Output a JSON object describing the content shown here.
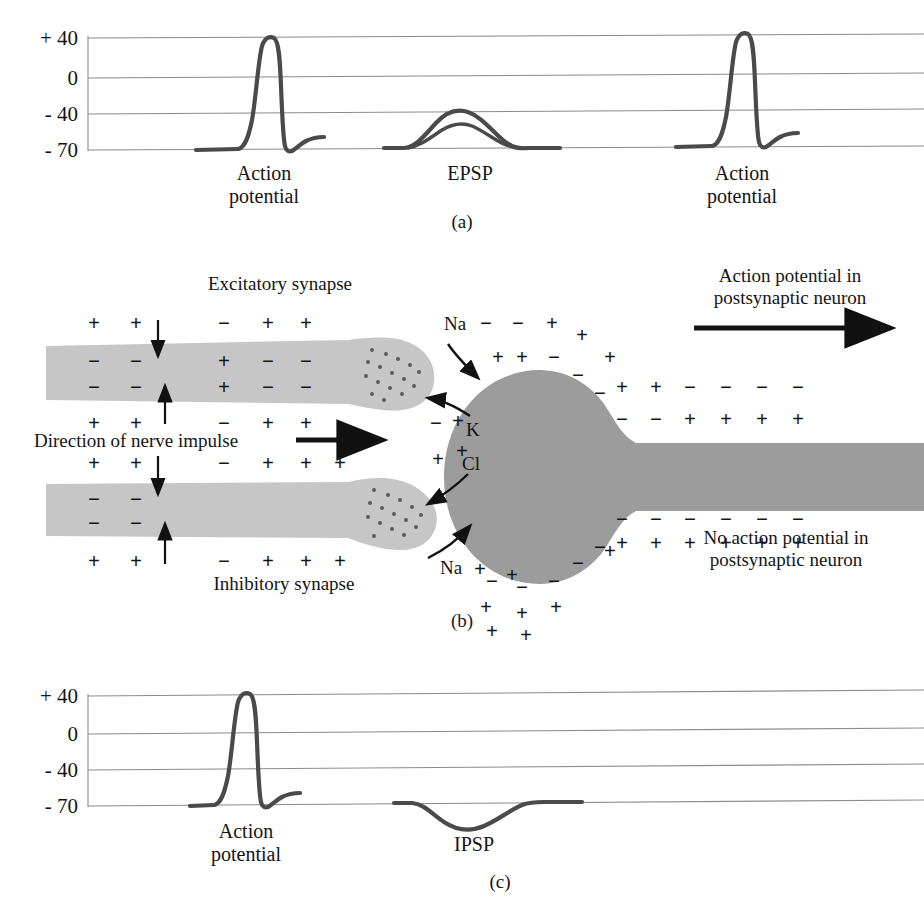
{
  "figure": {
    "colors": {
      "presynaptic_gray": "#c6c6c6",
      "postsynaptic_gray": "#9c9c9c",
      "trace": "#4a4a4a",
      "gridline": "#8b8b8b",
      "text": "#141414"
    }
  },
  "panel_a": {
    "id_label": "(a)",
    "y_axis": {
      "unit": "mV",
      "ticks": [
        "+ 40",
        "0",
        "- 40",
        "- 70"
      ],
      "values": [
        40,
        0,
        -40,
        -70
      ]
    },
    "events": [
      {
        "label_line1": "Action",
        "label_line2": "potential",
        "type": "action-potential",
        "peak_mv": 42,
        "baseline_mv": -70
      },
      {
        "label_line1": "EPSP",
        "label_line2": "",
        "type": "epsp",
        "peak_mv": -38,
        "baseline_mv": -70
      },
      {
        "label_line1": "Action",
        "label_line2": "potential",
        "type": "action-potential",
        "peak_mv": 42,
        "baseline_mv": -70
      }
    ]
  },
  "panel_b": {
    "id_label": "(b)",
    "excitatory_label": "Excitatory synapse",
    "inhibitory_label": "Inhibitory synapse",
    "direction_label": "Direction of nerve impulse",
    "action_potential_label_line1": "Action potential in",
    "action_potential_label_line2": "postsynaptic neuron",
    "no_action_potential_label_line1": "No action potential in",
    "no_action_potential_label_line2": "postsynaptic neuron",
    "ions": [
      {
        "name": "Na",
        "position": "upper-cleft",
        "direction": "into-soma"
      },
      {
        "name": "K",
        "position": "upper-cleft",
        "direction": "out-of-soma"
      },
      {
        "name": "Cl",
        "position": "lower-cleft",
        "direction": "out-of-soma"
      },
      {
        "name": "Na",
        "position": "lower-cleft",
        "direction": "into-soma"
      }
    ],
    "excitatory_axon_charges": {
      "outer_top": [
        "+",
        "+",
        "-",
        "+",
        "+"
      ],
      "inner_top": [
        "-",
        "-",
        "+",
        "-",
        "-"
      ],
      "inner_bottom": [
        "-",
        "-",
        "+",
        "-",
        "-"
      ],
      "outer_bottom": [
        "+",
        "+",
        "-",
        "+",
        "+"
      ]
    },
    "inhibitory_axon_charges": {
      "outer_top": [
        "+",
        "+",
        "-",
        "+",
        "+",
        "+"
      ],
      "inner_top": [
        "-",
        "-"
      ],
      "inner_bottom": [
        "-",
        "-"
      ],
      "outer_bottom": [
        "+",
        "+",
        "-",
        "+",
        "+",
        "+"
      ]
    },
    "soma_charges": {
      "outer_top": [
        "-",
        "-",
        "+",
        "+",
        "+",
        "+",
        "+"
      ],
      "inner_top": [
        "+",
        "+",
        "-",
        "-",
        "-",
        "-",
        "-"
      ],
      "outer_bottom": [
        "-",
        "-",
        "-",
        "+",
        "+",
        "+",
        "+"
      ],
      "inner_bottom": [
        "-",
        "-",
        "-",
        "-",
        "-",
        "-",
        "-"
      ]
    },
    "postsynaptic_axon_charges": {
      "outer_top": [
        "+",
        "-",
        "-",
        "-",
        "-"
      ],
      "inner_top": [
        "-",
        "+",
        "+",
        "+",
        "+"
      ],
      "inner_bottom": [
        "-",
        "-",
        "-",
        "-",
        "-",
        "-"
      ],
      "outer_bottom": [
        "+",
        "+",
        "+",
        "+",
        "+",
        "+"
      ]
    }
  },
  "panel_c": {
    "id_label": "(c)",
    "y_axis": {
      "unit": "mV",
      "ticks": [
        "+ 40",
        "0",
        "- 40",
        "- 70"
      ],
      "values": [
        40,
        0,
        -40,
        -70
      ]
    },
    "events": [
      {
        "label_line1": "Action",
        "label_line2": "potential",
        "type": "action-potential",
        "peak_mv": 42,
        "baseline_mv": -70
      },
      {
        "label_line1": "IPSP",
        "label_line2": "",
        "type": "ipsp",
        "trough_mv": -82,
        "baseline_mv": -70
      }
    ]
  }
}
